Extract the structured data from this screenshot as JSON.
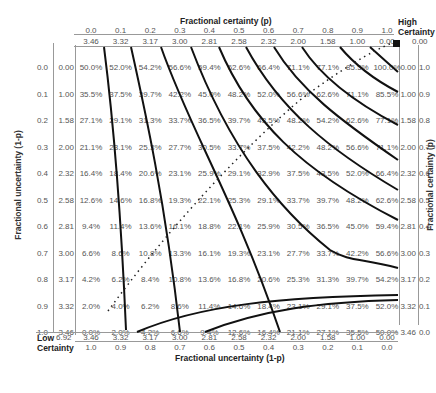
{
  "chart_data": {
    "type": "table",
    "title": "",
    "top_axis": {
      "label": "Fractional certainty (p)",
      "p_values": [
        "0.0",
        "0.1",
        "0.2",
        "0.3",
        "0.4",
        "0.5",
        "0.6",
        "0.7",
        "0.8",
        "0.9",
        "1.0"
      ],
      "bits_values": [
        "3.46",
        "3.32",
        "3.17",
        "3.00",
        "2.81",
        "2.58",
        "2.32",
        "2.00",
        "1.58",
        "1.00",
        "0.00"
      ],
      "corner_label_line1": "High",
      "corner_label_line2": "Certainty",
      "corner_value": "0.00"
    },
    "bottom_axis": {
      "label": "Fractional uncertainty (1-p)",
      "bits_values": [
        "3.46",
        "3.32",
        "3.17",
        "3.00",
        "2.81",
        "2.58",
        "2.32",
        "2.00",
        "1.58",
        "1.00",
        "0.00"
      ],
      "q_values": [
        "1.0",
        "0.9",
        "0.8",
        "0.7",
        "0.6",
        "0.5",
        "0.4",
        "0.3",
        "0.2",
        "0.1",
        "0.0"
      ],
      "corner_label_line1": "Low",
      "corner_label_line2": "Certainty",
      "corner_value": "6.92"
    },
    "left_axis": {
      "label": "Fractional uncertainty (1-p)",
      "q_values": [
        "0.0",
        "0.1",
        "0.2",
        "0.3",
        "0.4",
        "0.5",
        "0.6",
        "0.7",
        "0.8",
        "0.9",
        "1.0"
      ],
      "bits_values": [
        "0.00",
        "1.00",
        "1.58",
        "2.00",
        "2.32",
        "2.58",
        "2.81",
        "3.00",
        "3.17",
        "3.32",
        "3.46"
      ]
    },
    "right_axis": {
      "label": "Fractional certainty (p)",
      "bits_values": [
        "0.00",
        "1.00",
        "1.58",
        "2.00",
        "2.32",
        "2.58",
        "2.81",
        "3.00",
        "3.17",
        "3.32",
        "3.46"
      ],
      "p_values": [
        "1.0",
        "0.9",
        "0.8",
        "0.7",
        "0.6",
        "0.5",
        "0.4",
        "0.3",
        "0.2",
        "0.1",
        "0.0"
      ]
    },
    "rows": [
      [
        "50.0%",
        "52.0%",
        "54.2%",
        "56.6%",
        "59.4%",
        "62.6%",
        "66.4%",
        "71.1%",
        "77.1%",
        "85.5%",
        "100.0%"
      ],
      [
        "35.5%",
        "37.5%",
        "39.7%",
        "42.2%",
        "45.0%",
        "48.2%",
        "52.0%",
        "56.6%",
        "62.6%",
        "71.1%",
        "85.5%"
      ],
      [
        "27.1%",
        "29.1%",
        "31.3%",
        "33.7%",
        "36.5%",
        "39.7%",
        "43.5%",
        "48.2%",
        "54.2%",
        "62.6%",
        "77.1%"
      ],
      [
        "21.1%",
        "23.1%",
        "25.3%",
        "27.7%",
        "30.5%",
        "33.7%",
        "37.5%",
        "42.2%",
        "48.2%",
        "56.6%",
        "71.1%"
      ],
      [
        "16.4%",
        "18.4%",
        "20.6%",
        "23.1%",
        "25.9%",
        "29.1%",
        "32.9%",
        "37.5%",
        "43.5%",
        "52.0%",
        "66.4%"
      ],
      [
        "12.6%",
        "14.6%",
        "16.8%",
        "19.3%",
        "22.1%",
        "25.3%",
        "29.1%",
        "33.7%",
        "39.7%",
        "48.2%",
        "62.6%"
      ],
      [
        "9.4%",
        "11.4%",
        "13.6%",
        "16.1%",
        "18.8%",
        "22.1%",
        "25.9%",
        "30.5%",
        "36.5%",
        "45.0%",
        "59.4%"
      ],
      [
        "6.6%",
        "8.6%",
        "10.8%",
        "13.3%",
        "16.1%",
        "19.3%",
        "23.1%",
        "27.7%",
        "33.7%",
        "42.2%",
        "56.6%"
      ],
      [
        "4.2%",
        "6.2%",
        "8.4%",
        "10.8%",
        "13.6%",
        "16.8%",
        "20.6%",
        "25.3%",
        "31.3%",
        "39.7%",
        "54.2%"
      ],
      [
        "2.0%",
        "4.0%",
        "6.2%",
        "8.6%",
        "11.4%",
        "14.6%",
        "18.4%",
        "23.1%",
        "29.1%",
        "37.5%",
        "52.0%"
      ],
      [
        "0.0%",
        "2.0%",
        "4.2%",
        "6.6%",
        "9.4%",
        "12.6%",
        "16.4%",
        "21.1%",
        "27.1%",
        "35.5%",
        "50.0%"
      ]
    ],
    "annotations": [
      "solid iso-contour curves",
      "dotted diagonal from low certainty to high certainty",
      "black square marker at high certainty corner"
    ]
  }
}
